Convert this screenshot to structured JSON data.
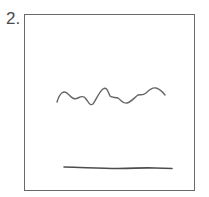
{
  "figure": {
    "number_label": "2.",
    "stroke_color": "#555555",
    "frame_color": "#6a6a6a",
    "elements": [
      {
        "name": "wavy-line",
        "kind": "hand-drawn wavy line"
      },
      {
        "name": "straight-line",
        "kind": "hand-drawn horizontal line"
      }
    ]
  }
}
